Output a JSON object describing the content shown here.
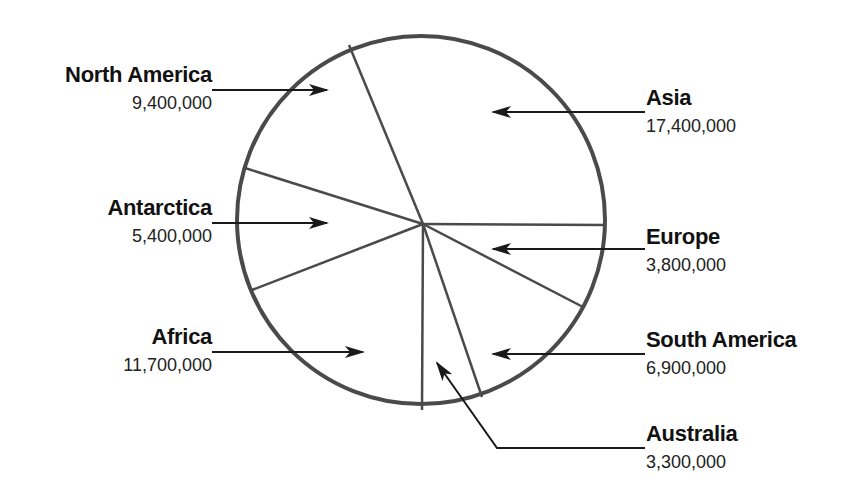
{
  "chart_data": {
    "type": "pie",
    "title": "",
    "unit": "square miles (land area)",
    "categories": [
      "Asia",
      "Europe",
      "South America",
      "Australia",
      "Africa",
      "Antarctica",
      "North America"
    ],
    "values": [
      17400000,
      3800000,
      6900000,
      3300000,
      11700000,
      5400000,
      9400000
    ],
    "value_labels": [
      "17,400,000",
      "3,800,000",
      "6,900,000",
      "3,300,000",
      "11,700,000",
      "5,400,000",
      "9,400,000"
    ],
    "legend": "none (callout labels with arrows)",
    "grid": false
  },
  "colors": {
    "outline": "#4a4a4a",
    "arrow": "#1a1a1a",
    "background": "#ffffff"
  },
  "geometry": {
    "circle": {
      "cx": 421,
      "cy": 220,
      "r": 184
    },
    "center": {
      "x": 423,
      "y": 224
    },
    "slice_edges": [
      {
        "name": "asia-europe",
        "x": 606,
        "y": 225
      },
      {
        "name": "europe-south-america",
        "x": 583,
        "y": 307
      },
      {
        "name": "south-america-australia",
        "x": 482,
        "y": 397
      },
      {
        "name": "australia-africa",
        "x": 422,
        "y": 410
      },
      {
        "name": "africa-antarctica",
        "x": 252,
        "y": 290
      },
      {
        "name": "antarctica-north-america",
        "x": 245,
        "y": 168
      },
      {
        "name": "north-america-asia",
        "x": 349,
        "y": 45
      }
    ]
  },
  "labels": [
    {
      "id": "north-america",
      "name": "North America",
      "value": "9,400,000",
      "side": "left",
      "text_x": 212,
      "name_y": 82,
      "value_y": 109,
      "arrow": {
        "from": [
          212,
          90
        ],
        "to": [
          327,
          90
        ]
      }
    },
    {
      "id": "antarctica",
      "name": "Antarctica",
      "value": "5,400,000",
      "side": "left",
      "text_x": 212,
      "name_y": 215,
      "value_y": 242,
      "arrow": {
        "from": [
          212,
          223
        ],
        "to": [
          327,
          223
        ]
      }
    },
    {
      "id": "africa",
      "name": "Africa",
      "value": "11,700,000",
      "side": "left",
      "text_x": 212,
      "name_y": 344,
      "value_y": 371,
      "arrow": {
        "from": [
          212,
          352
        ],
        "to": [
          363,
          352
        ]
      }
    },
    {
      "id": "asia",
      "name": "Asia",
      "value": "17,400,000",
      "side": "right",
      "text_x": 646,
      "name_y": 105,
      "value_y": 132,
      "arrow": {
        "from": [
          645,
          112
        ],
        "to": [
          493,
          112
        ]
      }
    },
    {
      "id": "europe",
      "name": "Europe",
      "value": "3,800,000",
      "side": "right",
      "text_x": 646,
      "name_y": 244,
      "value_y": 271,
      "arrow": {
        "from": [
          645,
          249
        ],
        "to": [
          493,
          249
        ]
      }
    },
    {
      "id": "south-america",
      "name": "South America",
      "value": "6,900,000",
      "side": "right",
      "text_x": 646,
      "name_y": 347,
      "value_y": 374,
      "arrow": {
        "from": [
          645,
          354
        ],
        "to": [
          493,
          354
        ]
      }
    },
    {
      "id": "australia",
      "name": "Australia",
      "value": "3,300,000",
      "side": "right",
      "text_x": 646,
      "name_y": 441,
      "value_y": 468,
      "arrow": {
        "from": [
          645,
          448
        ],
        "via": [
          497,
          448
        ],
        "to": [
          437,
          363
        ]
      }
    }
  ]
}
